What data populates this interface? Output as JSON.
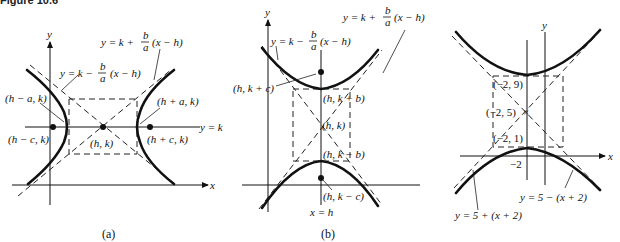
{
  "figure": {
    "header": "Figure 10.6"
  },
  "panels": [
    {
      "id": "a",
      "caption": "(a)",
      "axes": {
        "x": "x",
        "y": "y"
      },
      "labels": {
        "asymptote_pos": "y = k + (b/a)(x − h)",
        "asymptote_neg": "y = k − (b/a)(x − h)",
        "vertex_left": "(h − a, k)",
        "vertex_right": "(h + a, k)",
        "focus_left": "(h − c, k)",
        "focus_right": "(h + c, k)",
        "center": "(h, k)",
        "line_yk": "y = k"
      }
    },
    {
      "id": "b",
      "caption": "(b)",
      "axes": {
        "x": "x",
        "y": "y"
      },
      "labels": {
        "asymptote_pos": "y = k + (b/a)(x − h)",
        "asymptote_neg": "y = k − (b/a)(x − h)",
        "focus_top": "(h, k + c)",
        "vertex_top": "(h, k + b)",
        "center": "(h, k)",
        "vertex_bottom": "(h, k − b)",
        "focus_bottom": "(h, k − c)",
        "line_xh": "x = h"
      }
    },
    {
      "id": "c",
      "caption": "",
      "axes": {
        "x": "x",
        "y": "y"
      },
      "labels": {
        "vertex_top": "(−2, 9)",
        "center": "(−2, 5)",
        "vertex_bottom": "(−2, 1)",
        "tick_x": "−2",
        "asymptote_neg": "y = 5 − (x + 2)",
        "asymptote_pos": "y = 5 + (x + 2)"
      }
    }
  ],
  "symbols": {
    "y_eq_k_plus": "y = k +",
    "y_eq_k_minus": "y = k −",
    "frac_num": "b",
    "frac_den": "a",
    "x_minus_h": "(x − h)"
  }
}
